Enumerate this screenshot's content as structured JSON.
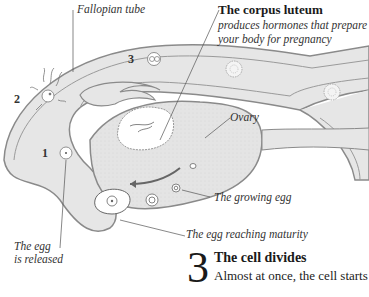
{
  "labels": {
    "fallopian_tube": "Fallopian tube",
    "corpus_luteum_title": "The corpus luteum",
    "corpus_luteum_desc_1": "produces hormones that prepare",
    "corpus_luteum_desc_2": "your body for pregnancy",
    "ovary": "Ovary",
    "growing_egg": "The growing egg",
    "egg_maturity": "The egg reaching maturity",
    "egg_released_1": "The egg",
    "egg_released_2": "is released"
  },
  "stage_numbers": [
    "1",
    "2",
    "3"
  ],
  "step": {
    "number": "3",
    "title": "The cell divides",
    "body": "Almost at once, the cell starts"
  },
  "colors": {
    "tissue_fill": "#e6e6e6",
    "outline": "#8a8a8a",
    "leader_line": "#555555",
    "text": "#2a2a2a"
  }
}
